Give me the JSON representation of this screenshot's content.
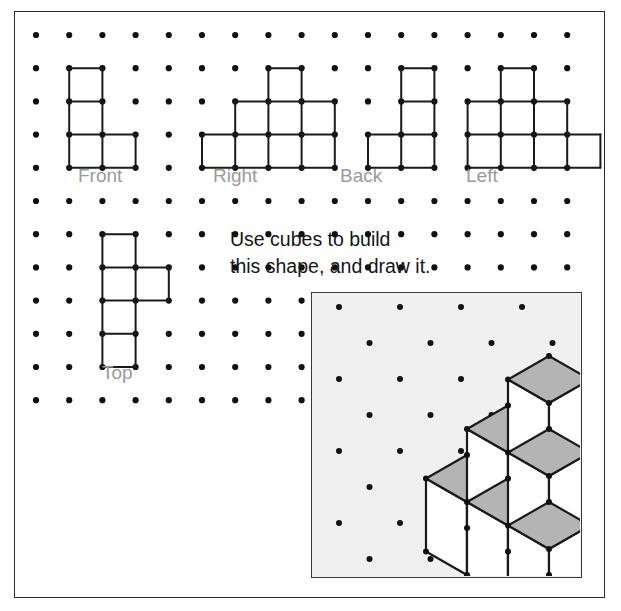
{
  "page": {
    "kind": "math-worksheet",
    "background_color": "#ffffff",
    "border_color": "#2b2b2b",
    "dot_color": "#111111",
    "line_color": "#1a1a1a",
    "label_color": "#9a9a9a",
    "text_color": "#151515",
    "panel_fill": "#f0f0f0",
    "cube_top_fill": "#b4b4b4",
    "cube_face_fill": "#ffffff"
  },
  "instructions": {
    "line1": "Use cubes to build",
    "line2": "this shape, and draw it.",
    "x": 230,
    "y": 228
  },
  "grid": {
    "origin_x": 36,
    "origin_y": 35,
    "spacing": 33.2,
    "cols": 18,
    "rows": 12,
    "dot_radius": 3.1
  },
  "views": [
    {
      "name": "front",
      "label": "Front",
      "label_x": 78,
      "label_y": 165,
      "origin_col": 1,
      "origin_row": 1,
      "cells": [
        {
          "c": 0,
          "r": 0
        },
        {
          "c": 0,
          "r": 1
        },
        {
          "c": 0,
          "r": 2
        },
        {
          "c": 1,
          "r": 2
        }
      ]
    },
    {
      "name": "right",
      "label": "Right",
      "label_x": 213,
      "label_y": 165,
      "origin_col": 5,
      "origin_row": 1,
      "cells": [
        {
          "c": 2,
          "r": 0
        },
        {
          "c": 1,
          "r": 1
        },
        {
          "c": 2,
          "r": 1
        },
        {
          "c": 3,
          "r": 1
        },
        {
          "c": 0,
          "r": 2
        },
        {
          "c": 1,
          "r": 2
        },
        {
          "c": 2,
          "r": 2
        },
        {
          "c": 3,
          "r": 2
        }
      ]
    },
    {
      "name": "back",
      "label": "Back",
      "label_x": 340,
      "label_y": 165,
      "origin_col": 10,
      "origin_row": 1,
      "cells": [
        {
          "c": 1,
          "r": 0
        },
        {
          "c": 1,
          "r": 1
        },
        {
          "c": 0,
          "r": 2
        },
        {
          "c": 1,
          "r": 2
        }
      ]
    },
    {
      "name": "left",
      "label": "Left",
      "label_x": 466,
      "label_y": 165,
      "origin_col": 13,
      "origin_row": 1,
      "cells": [
        {
          "c": 1,
          "r": 0
        },
        {
          "c": 0,
          "r": 1
        },
        {
          "c": 1,
          "r": 1
        },
        {
          "c": 2,
          "r": 1
        },
        {
          "c": 0,
          "r": 2
        },
        {
          "c": 1,
          "r": 2
        },
        {
          "c": 2,
          "r": 2
        },
        {
          "c": 3,
          "r": 2
        }
      ]
    },
    {
      "name": "top",
      "label": "Top",
      "label_x": 102,
      "label_y": 362,
      "origin_col": 2,
      "origin_row": 6,
      "cells": [
        {
          "c": 0,
          "r": 0
        },
        {
          "c": 0,
          "r": 1
        },
        {
          "c": 1,
          "r": 1
        },
        {
          "c": 0,
          "r": 2
        },
        {
          "c": 0,
          "r": 3
        }
      ]
    }
  ],
  "iso_panel": {
    "x": 311,
    "y": 292,
    "width": 271,
    "height": 286,
    "dot_grid": {
      "origin_x": 27,
      "origin_y": 14,
      "dx": 61,
      "dy": 36,
      "cols": 5,
      "rows": 8,
      "dot_radius": 3.0
    },
    "drawing": {
      "type": "isometric-cube-stack",
      "cube_half_width": 41,
      "cube_half_height": 23.5,
      "cube_height": 73,
      "origin_x": 155,
      "origin_y": 235,
      "cubes": [
        {
          "x": 0,
          "y": 0,
          "z": 0
        },
        {
          "x": 1,
          "y": 0,
          "z": 0
        },
        {
          "x": 2,
          "y": 0,
          "z": 0
        },
        {
          "x": 1,
          "y": 0,
          "z": 1
        },
        {
          "x": 2,
          "y": 0,
          "z": 1
        },
        {
          "x": 2,
          "y": 0,
          "z": 2
        }
      ]
    }
  }
}
